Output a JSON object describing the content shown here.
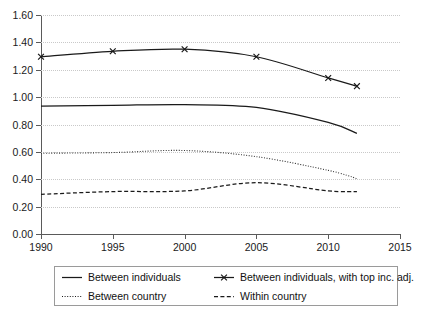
{
  "chart_data": {
    "type": "line",
    "title": "",
    "xlabel": "",
    "ylabel": "",
    "xlim": [
      1990,
      2015
    ],
    "ylim": [
      0.0,
      1.6
    ],
    "ystep": 0.2,
    "xstep": 5,
    "grid": "horizontal-dotted",
    "legend_position": "bottom",
    "x_ticks": [
      "1990",
      "1995",
      "2000",
      "2005",
      "2010",
      "2015"
    ],
    "y_ticks": [
      "0.00",
      "0.20",
      "0.40",
      "0.60",
      "0.80",
      "1.00",
      "1.20",
      "1.40",
      "1.60"
    ],
    "x": [
      1990,
      1995,
      2000,
      2005,
      2010,
      2012
    ],
    "series": [
      {
        "name": "Between individuals",
        "style": "solid",
        "marker": "none",
        "color": "#1a1a1a",
        "values": [
          0.935,
          0.94,
          0.945,
          0.925,
          0.815,
          0.735
        ]
      },
      {
        "name": "Between individuals, with top inc. adj.",
        "style": "solid",
        "marker": "x",
        "color": "#1a1a1a",
        "values": [
          1.295,
          1.335,
          1.35,
          1.295,
          1.14,
          1.08
        ]
      },
      {
        "name": "Between country",
        "style": "dotted",
        "marker": "none",
        "color": "#333333",
        "values": [
          0.59,
          0.595,
          0.61,
          0.565,
          0.465,
          0.405
        ]
      },
      {
        "name": "Within country",
        "style": "dashed",
        "marker": "none",
        "color": "#1a1a1a",
        "values": [
          0.29,
          0.31,
          0.315,
          0.375,
          0.315,
          0.31
        ]
      }
    ]
  },
  "legend": {
    "items": [
      {
        "label": "Between individuals",
        "style": "solid",
        "marker": "none"
      },
      {
        "label": "Between individuals, with top inc. adj.",
        "style": "solid",
        "marker": "x"
      },
      {
        "label": "Between country",
        "style": "dotted",
        "marker": "none"
      },
      {
        "label": "Within country",
        "style": "dashed",
        "marker": "none"
      }
    ]
  }
}
